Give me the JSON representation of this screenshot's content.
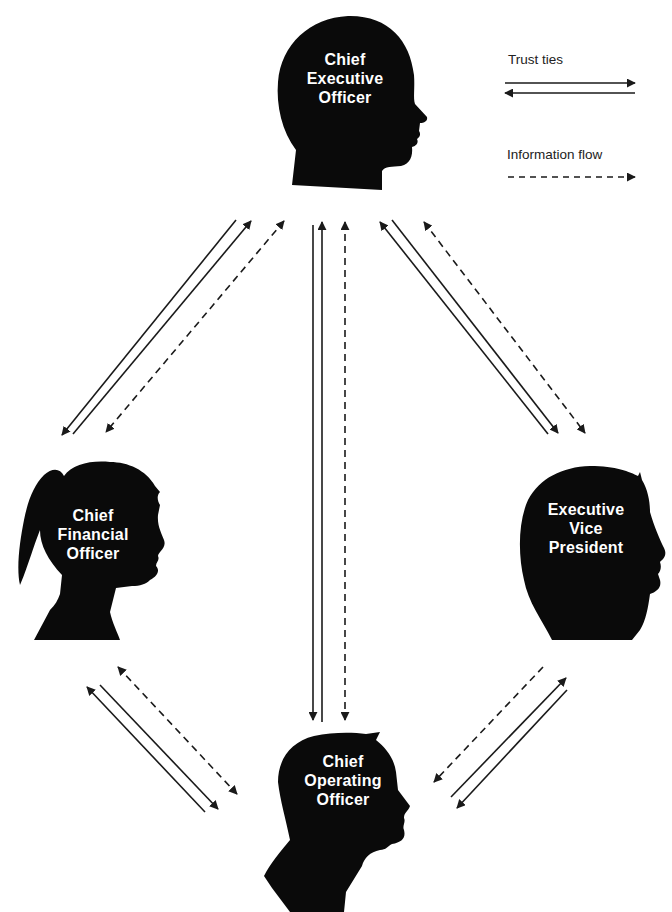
{
  "diagram": {
    "type": "network",
    "nodes": [
      {
        "id": "ceo",
        "label_lines": [
          "Chief",
          "Executive",
          "Officer"
        ],
        "silhouette": "male-head-profile"
      },
      {
        "id": "cfo",
        "label_lines": [
          "Chief",
          "Financial",
          "Officer"
        ],
        "silhouette": "female-ponytail-profile"
      },
      {
        "id": "evp",
        "label_lines": [
          "Executive",
          "Vice",
          "President"
        ],
        "silhouette": "male-head-profile"
      },
      {
        "id": "coo",
        "label_lines": [
          "Chief",
          "Operating",
          "Officer"
        ],
        "silhouette": "male-head-shoulders-profile"
      }
    ],
    "edges": [
      {
        "from": "ceo",
        "to": "cfo",
        "trust_ties": "bidirectional",
        "information_flow": "bidirectional"
      },
      {
        "from": "ceo",
        "to": "coo",
        "trust_ties": "bidirectional",
        "information_flow": "bidirectional"
      },
      {
        "from": "ceo",
        "to": "evp",
        "trust_ties": "bidirectional",
        "information_flow": "bidirectional"
      },
      {
        "from": "cfo",
        "to": "coo",
        "trust_ties": "bidirectional",
        "information_flow": "bidirectional"
      },
      {
        "from": "evp",
        "to": "coo",
        "trust_ties": "bidirectional",
        "information_flow": "evp-to-coo"
      }
    ]
  },
  "legend": {
    "trust_label": "Trust ties",
    "info_label": "Information flow"
  },
  "colors": {
    "silhouette": "#0a0a0a",
    "label_text": "#ffffff",
    "arrow": "#1a1a1a",
    "background": "#ffffff"
  }
}
